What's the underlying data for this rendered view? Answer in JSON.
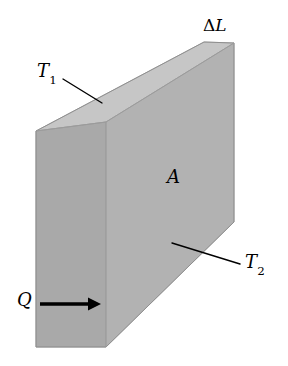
{
  "figure": {
    "background_color": "#ffffff"
  },
  "solid": {
    "name": "rectangular-slab",
    "faces": {
      "front_large": {
        "label": "front-face",
        "color": "#b1b1b1"
      },
      "left_small": {
        "label": "left-end-face",
        "color": "#a8a8a8"
      },
      "top": {
        "label": "top-face",
        "color": "#c6c6c6"
      }
    },
    "edge_color": "#8a8a8a"
  },
  "labels": {
    "thickness": {
      "delta": "Δ",
      "symbol": "L",
      "text": "ΔL",
      "name": "thickness-label"
    },
    "temperature_hot": {
      "symbol": "T",
      "subscript": "1",
      "text": "T1",
      "name": "temperature-t1-label"
    },
    "temperature_cold": {
      "symbol": "T",
      "subscript": "2",
      "text": "T2",
      "name": "temperature-t2-label"
    },
    "area": {
      "symbol": "A",
      "text": "A",
      "name": "area-label"
    },
    "heat_flow": {
      "symbol": "Q",
      "text": "Q",
      "name": "heat-flow-label"
    }
  },
  "annotations": {
    "arrow": {
      "name": "heat-flow-arrow",
      "direction": "right",
      "color": "#000000"
    },
    "leader_t1": {
      "name": "leader-line-t1",
      "color": "#000000"
    },
    "leader_t2": {
      "name": "leader-line-t2",
      "color": "#000000"
    }
  }
}
